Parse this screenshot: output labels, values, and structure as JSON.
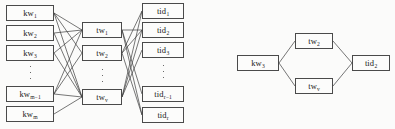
{
  "figure": {
    "background_color": "#fbfbfa",
    "node_fill": "#fcfcfb",
    "node_border_color": "#4a4a4a",
    "edge_color": "#3c3c3c",
    "width": 395,
    "height": 129
  },
  "panels": [
    {
      "id": "left-panel",
      "name": "full-mapping-panel",
      "columns": [
        {
          "id": "kw-column",
          "name": "keyword-column",
          "nodes": [
            {
              "id": "kw1",
              "base": "kw",
              "sub": "1",
              "x": 6,
              "y": 5,
              "w": 48,
              "h": 16
            },
            {
              "id": "kw2",
              "base": "kw",
              "sub": "2",
              "x": 6,
              "y": 25,
              "w": 48,
              "h": 16
            },
            {
              "id": "kw3",
              "base": "kw",
              "sub": "3",
              "x": 6,
              "y": 45,
              "w": 48,
              "h": 16
            },
            {
              "id": "kwm1",
              "base": "kw",
              "sub": "m−1",
              "x": 6,
              "y": 86,
              "w": 48,
              "h": 16
            },
            {
              "id": "kwm",
              "base": "kw",
              "sub": "m",
              "x": 6,
              "y": 106,
              "w": 48,
              "h": 16
            }
          ],
          "ellipsis": {
            "id": "kw-ellipsis",
            "x": 29,
            "y": 66,
            "w": 3,
            "h": 13
          }
        },
        {
          "id": "tw-column",
          "name": "trapdoor-column",
          "nodes": [
            {
              "id": "tw1",
              "base": "tw",
              "sub": "1",
              "x": 82,
              "y": 22,
              "w": 40,
              "h": 16
            },
            {
              "id": "tw2",
              "base": "tw",
              "sub": "2",
              "x": 82,
              "y": 45,
              "w": 40,
              "h": 16
            },
            {
              "id": "twv",
              "base": "tw",
              "sub": "v",
              "x": 82,
              "y": 89,
              "w": 40,
              "h": 16
            }
          ],
          "ellipsis": {
            "id": "tw-ellipsis",
            "x": 101,
            "y": 69,
            "w": 3,
            "h": 13
          }
        },
        {
          "id": "tid-column",
          "name": "document-id-column",
          "nodes": [
            {
              "id": "tid1",
              "base": "tid",
              "sub": "1",
              "x": 142,
              "y": 3,
              "w": 42,
              "h": 16
            },
            {
              "id": "tid2",
              "base": "tid",
              "sub": "2",
              "x": 142,
              "y": 22,
              "w": 42,
              "h": 16
            },
            {
              "id": "tid3",
              "base": "tid",
              "sub": "3",
              "x": 142,
              "y": 42,
              "w": 42,
              "h": 16
            },
            {
              "id": "tidr1",
              "base": "tid",
              "sub": "r−1",
              "x": 142,
              "y": 86,
              "w": 42,
              "h": 16
            },
            {
              "id": "tidr",
              "base": "tid",
              "sub": "r",
              "x": 142,
              "y": 107,
              "w": 42,
              "h": 16
            }
          ],
          "ellipsis": {
            "id": "tid-ellipsis",
            "x": 162,
            "y": 65,
            "w": 3,
            "h": 13
          }
        }
      ],
      "edges": [
        {
          "from": "kw1",
          "to": "tw1"
        },
        {
          "from": "kw1",
          "to": "tw2"
        },
        {
          "from": "kw1",
          "to": "twv"
        },
        {
          "from": "kw2",
          "to": "tw1"
        },
        {
          "from": "kw2",
          "to": "twv"
        },
        {
          "from": "kw3",
          "to": "tw1"
        },
        {
          "from": "kw3",
          "to": "twv"
        },
        {
          "from": "kwm1",
          "to": "tw1"
        },
        {
          "from": "kwm1",
          "to": "tw2"
        },
        {
          "from": "kwm1",
          "to": "twv"
        },
        {
          "from": "kwm",
          "to": "twv"
        },
        {
          "from": "tw1",
          "to": "tid2"
        },
        {
          "from": "tw1",
          "to": "tidr1"
        },
        {
          "from": "tw1",
          "to": "tidr"
        },
        {
          "from": "tw2",
          "to": "tid1"
        },
        {
          "from": "tw2",
          "to": "tid2"
        },
        {
          "from": "tw2",
          "to": "tidr"
        },
        {
          "from": "twv",
          "to": "tid1"
        },
        {
          "from": "twv",
          "to": "tid2"
        },
        {
          "from": "twv",
          "to": "tid3"
        }
      ]
    },
    {
      "id": "right-panel",
      "name": "single-keyword-path-panel",
      "columns": [
        {
          "id": "r-kw-column",
          "name": "keyword-column",
          "nodes": [
            {
              "id": "rkw3",
              "base": "kw",
              "sub": "3",
              "x": 237,
              "y": 55,
              "w": 42,
              "h": 16
            }
          ]
        },
        {
          "id": "r-tw-column",
          "name": "trapdoor-column",
          "nodes": [
            {
              "id": "rtw2",
              "base": "tw",
              "sub": "2",
              "x": 295,
              "y": 33,
              "w": 38,
              "h": 16
            },
            {
              "id": "rtwv",
              "base": "tw",
              "sub": "v",
              "x": 295,
              "y": 78,
              "w": 38,
              "h": 16
            }
          ]
        },
        {
          "id": "r-tid-column",
          "name": "document-id-column",
          "nodes": [
            {
              "id": "rtid2",
              "base": "tid",
              "sub": "2",
              "x": 352,
              "y": 55,
              "w": 38,
              "h": 16
            }
          ]
        }
      ],
      "edges": [
        {
          "from": "rkw3",
          "to": "rtw2"
        },
        {
          "from": "rkw3",
          "to": "rtwv"
        },
        {
          "from": "rtw2",
          "to": "rtid2"
        },
        {
          "from": "rtwv",
          "to": "rtid2"
        }
      ]
    }
  ]
}
